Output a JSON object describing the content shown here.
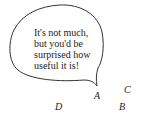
{
  "speech_bubble": {
    "lines": [
      "It's not much,",
      "but you'd be",
      "surprised how",
      "useful it is!"
    ]
  },
  "points": [
    {
      "label": "A",
      "x": 94,
      "y": 91
    },
    {
      "label": "B",
      "x": 119,
      "y": 102
    },
    {
      "label": "C",
      "x": 124,
      "y": 85
    },
    {
      "label": "D",
      "x": 55,
      "y": 102
    }
  ],
  "colors": {
    "stroke": "#333333",
    "text": "#222222",
    "background": "#ffffff"
  }
}
